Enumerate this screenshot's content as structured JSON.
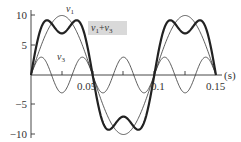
{
  "chart_data": {
    "type": "line",
    "title": "",
    "xlabel": "(s)",
    "ylabel": "",
    "xlim": [
      0,
      0.15
    ],
    "ylim": [
      -10,
      10
    ],
    "grid": false,
    "x_ticks": [
      "0.05",
      "0.1",
      "0.15"
    ],
    "y_ticks": [
      "10",
      "5",
      "−5",
      "−10"
    ],
    "series": [
      {
        "name": "v1",
        "description": "fundamental sine, amplitude 10, period 0.1 s",
        "amplitude": 10,
        "period": 0.1,
        "style": "thin"
      },
      {
        "name": "v3",
        "description": "third harmonic sine, amplitude 3, period 0.0333 s",
        "amplitude": 3,
        "period": 0.0333,
        "style": "thin"
      },
      {
        "name": "v1+v3",
        "description": "sum of v1 and v3",
        "style": "thick"
      }
    ],
    "annotations": [
      {
        "text": "v1",
        "target": "v1"
      },
      {
        "text": "v3",
        "target": "v3"
      },
      {
        "text": "v1+v3",
        "target": "v1+v3",
        "boxed": true,
        "box_color": "#d9d9d9"
      }
    ]
  },
  "labels": {
    "x_unit": "(s)",
    "x_tick_005": "0.05",
    "x_tick_01": "0.1",
    "x_tick_015": "0.15",
    "y_tick_10": "10",
    "y_tick_5": "5",
    "y_tick_m5": "−5",
    "y_tick_m10": "−10",
    "v1_main": "v",
    "v1_sub": "1",
    "v3_main": "v",
    "v3_sub": "3",
    "sum_a": "v",
    "sum_a_sub": "1",
    "sum_plus": "+",
    "sum_b": "v",
    "sum_b_sub": "3"
  },
  "colors": {
    "axis": "#333333",
    "curve": "#333333",
    "label_box": "#d9d9d9"
  }
}
